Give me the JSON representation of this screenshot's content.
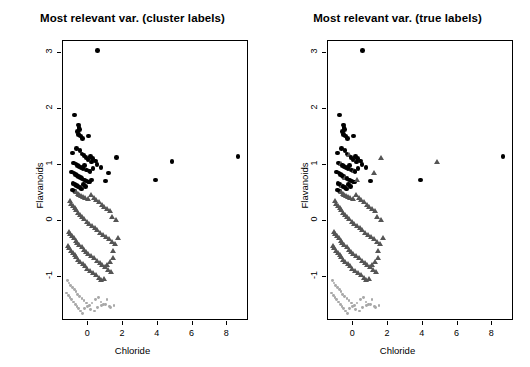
{
  "figure": {
    "background": "#ffffff",
    "width": 530,
    "height": 367
  },
  "panels": [
    {
      "title": "Most relevant var. (cluster labels)"
    },
    {
      "title": "Most relevant var. (true labels)"
    }
  ],
  "axes": {
    "xlabel": "Chloride",
    "ylabel": "Flavanoids",
    "xticks": [
      "0",
      "2",
      "4",
      "6",
      "8"
    ],
    "yticks": [
      "-1",
      "0",
      "1",
      "2",
      "3"
    ],
    "xtick_values": [
      0,
      2,
      4,
      6,
      8
    ],
    "ytick_values": [
      -1,
      0,
      1,
      2,
      3
    ],
    "xlim": [
      -1.45,
      9.25
    ],
    "ylim": [
      -1.78,
      3.22
    ],
    "grid": false,
    "frame": true
  },
  "colors": {
    "group1": "#000000",
    "group2": "#555555",
    "group3": "#a8a8a8",
    "frame": "#000000",
    "text": "#000000"
  },
  "chart_data": {
    "type": "scatter",
    "xlabel": "Chloride",
    "ylabel": "Flavanoids",
    "xlim": [
      -1.45,
      9.25
    ],
    "ylim": [
      -1.78,
      3.22
    ],
    "grid": false,
    "legend": "none",
    "symbols": {
      "group1": "filled-circle",
      "group2": "filled-triangle",
      "group3": "small-filled-circle"
    },
    "x": [
      0.55,
      -0.78,
      -0.57,
      -0.52,
      -0.49,
      -0.6,
      -0.55,
      -0.44,
      -0.33,
      0.03,
      -0.9,
      -0.66,
      -0.48,
      -0.36,
      -0.25,
      -0.12,
      0.0,
      0.12,
      0.26,
      0.41,
      -0.86,
      -0.7,
      -0.62,
      -0.52,
      -0.42,
      -0.3,
      -0.2,
      -0.1,
      0.04,
      0.18,
      -0.95,
      -0.81,
      -0.72,
      -0.64,
      -0.55,
      -0.45,
      -0.35,
      -0.23,
      -0.1,
      0.08,
      -0.88,
      -0.75,
      -0.66,
      -0.58,
      -0.48,
      -0.38,
      -0.26,
      -0.14,
      0.02,
      0.2,
      -0.92,
      -0.8,
      -0.7,
      -0.6,
      -0.5,
      -0.4,
      -0.28,
      -0.15,
      0.0,
      0.16,
      0.32,
      0.48,
      0.62,
      0.78,
      0.92,
      1.08,
      1.24,
      1.4,
      1.58,
      1.72,
      -1.05,
      -0.96,
      -0.88,
      -0.78,
      -0.68,
      -0.58,
      -0.46,
      -0.34,
      -0.22,
      -0.08,
      0.08,
      0.22,
      0.38,
      0.54,
      0.7,
      0.88,
      1.04,
      1.2,
      1.36,
      1.52,
      -1.12,
      -1.02,
      -0.92,
      -0.82,
      -0.72,
      -0.62,
      -0.5,
      -0.38,
      -0.26,
      -0.12,
      0.02,
      0.18,
      0.34,
      0.5,
      0.66,
      0.82,
      0.98,
      1.14,
      1.3,
      1.46,
      -1.18,
      -1.08,
      -0.98,
      -0.88,
      -0.78,
      -0.68,
      -0.56,
      -0.44,
      -0.32,
      -0.18,
      -0.04,
      0.12,
      0.28,
      0.44,
      0.6,
      0.76,
      0.92,
      1.1,
      1.26,
      1.42,
      -1.2,
      -1.1,
      -1.0,
      -0.9,
      -0.8,
      -0.7,
      -0.6,
      -0.48,
      -0.36,
      -0.24,
      -0.1,
      0.06,
      0.22,
      0.4,
      0.58,
      0.74,
      0.9,
      1.08,
      1.24,
      1.48,
      3.88,
      4.82,
      8.62,
      1.62,
      1.18,
      0.98,
      0.74,
      0.5,
      0.28,
      0.1,
      -1.25,
      -1.15,
      -1.05,
      -0.95,
      -0.85,
      -0.75,
      -0.65,
      -0.55,
      -0.45,
      -0.35,
      -0.2,
      -0.05,
      0.14,
      0.34,
      0.54,
      0.76,
      1.0,
      1.3
    ],
    "y": [
      3.05,
      1.9,
      1.72,
      1.68,
      1.64,
      1.6,
      1.55,
      1.52,
      1.48,
      1.52,
      1.22,
      1.3,
      1.26,
      1.2,
      1.18,
      1.14,
      1.1,
      1.16,
      1.12,
      1.08,
      1.04,
      1.02,
      1.0,
      0.98,
      0.96,
      0.94,
      1.0,
      0.92,
      0.9,
      1.06,
      0.88,
      0.86,
      0.84,
      0.82,
      0.8,
      0.78,
      0.76,
      0.74,
      0.72,
      0.7,
      0.68,
      0.66,
      0.64,
      0.62,
      0.6,
      0.58,
      0.66,
      0.62,
      0.7,
      0.74,
      0.56,
      0.54,
      0.52,
      0.5,
      0.48,
      0.46,
      0.44,
      0.42,
      0.4,
      0.48,
      0.42,
      0.38,
      0.34,
      0.3,
      0.26,
      0.22,
      0.18,
      0.08,
      0.02,
      -0.3,
      0.36,
      0.32,
      0.28,
      0.24,
      0.2,
      0.16,
      0.12,
      0.08,
      0.04,
      0.0,
      -0.04,
      -0.08,
      -0.12,
      -0.16,
      -0.2,
      -0.24,
      -0.28,
      -0.32,
      -0.36,
      -0.4,
      -0.18,
      -0.22,
      -0.26,
      -0.3,
      -0.34,
      -0.38,
      -0.42,
      -0.46,
      -0.5,
      -0.54,
      -0.58,
      -0.62,
      -0.66,
      -0.7,
      -0.74,
      -0.78,
      -0.82,
      -0.86,
      -0.9,
      -0.66,
      -0.44,
      -0.48,
      -0.52,
      -0.56,
      -0.6,
      -0.64,
      -0.68,
      -0.72,
      -0.76,
      -0.8,
      -0.84,
      -0.88,
      -0.92,
      -0.96,
      -1.0,
      -1.04,
      -1.02,
      -0.78,
      -0.72,
      -0.52,
      -1.06,
      -1.1,
      -1.14,
      -1.18,
      -1.22,
      -1.26,
      -1.3,
      -1.34,
      -1.38,
      -1.42,
      -1.46,
      -1.5,
      -1.46,
      -1.4,
      -1.36,
      -1.44,
      -1.48,
      -1.4,
      -1.52,
      -1.5,
      0.74,
      1.07,
      1.16,
      1.14,
      0.86,
      0.72,
      0.96,
      1.01,
      0.94,
      0.89,
      -1.28,
      -1.32,
      -1.36,
      -1.4,
      -1.44,
      -1.48,
      -1.52,
      -1.56,
      -1.6,
      -1.64,
      -1.56,
      -1.52,
      -1.58,
      -1.6,
      -1.54,
      -1.5,
      -1.48,
      -1.54
    ],
    "series": [
      {
        "name": "group1",
        "symbol": "filled-circle",
        "color": "#000000",
        "count": 59
      },
      {
        "name": "group2",
        "symbol": "filled-triangle",
        "color": "#555555",
        "count": 71
      },
      {
        "name": "group3",
        "symbol": "small-filled-circle",
        "color": "#a8a8a8",
        "count": 48
      }
    ],
    "n_points": 178
  }
}
